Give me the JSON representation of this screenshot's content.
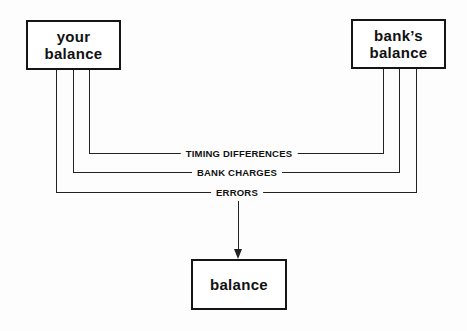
{
  "diagram": {
    "type": "reconciliation-flow",
    "nodes": {
      "your_balance": {
        "line1": "your",
        "line2": "balance"
      },
      "banks_balance": {
        "line1": "bank’s",
        "line2": "balance"
      },
      "result": {
        "label": "balance"
      }
    },
    "connectors": [
      {
        "label": "TIMING DIFFERENCES",
        "from": [
          "your balance",
          "bank's balance"
        ]
      },
      {
        "label": "BANK CHARGES",
        "from": [
          "your balance",
          "bank's balance"
        ]
      },
      {
        "label": "ERRORS",
        "from": [
          "your balance",
          "bank's balance"
        ],
        "to": "balance"
      }
    ]
  }
}
